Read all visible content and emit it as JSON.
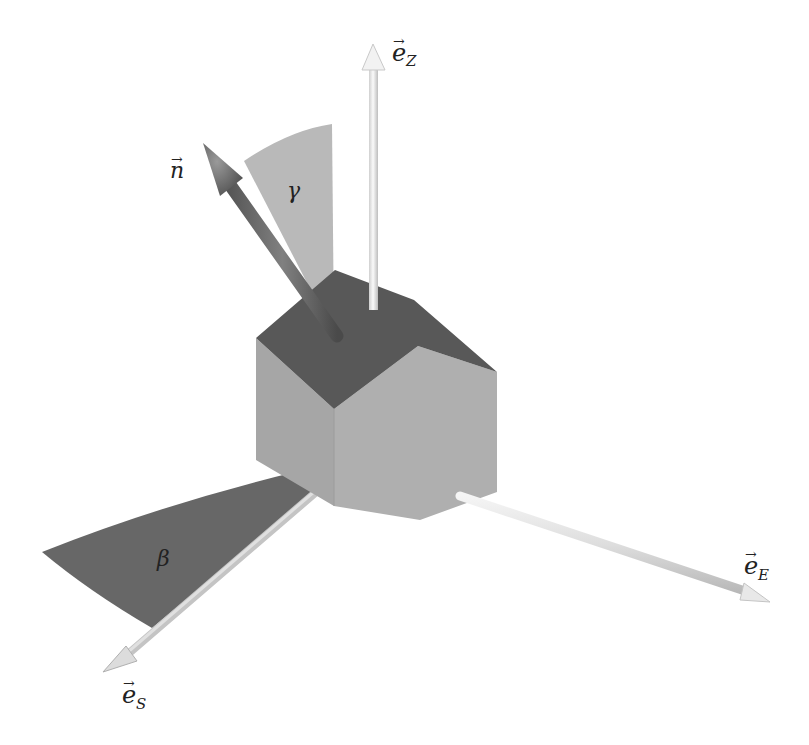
{
  "diagram": {
    "labels": {
      "normal": "n",
      "zenith_axis": "e",
      "zenith_sub": "Z",
      "east_axis": "e",
      "east_sub": "E",
      "south_axis": "e",
      "south_sub": "S",
      "tilt_angle": "γ",
      "azimuth_angle": "β"
    },
    "colors": {
      "background": "#ffffff",
      "house_front_left": "#a7a7a7",
      "house_front_right": "#b0b0b0",
      "roof": "#585858",
      "gamma_sector": "#b9b9b9",
      "beta_sector": "#676767",
      "normal_arrow": "#707070",
      "axis_arrows": "#e4e4e4",
      "text": "#222222"
    }
  }
}
